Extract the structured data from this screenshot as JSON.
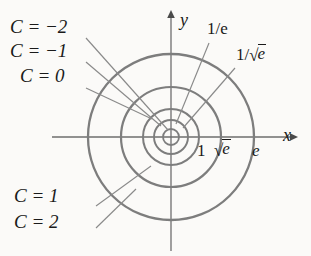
{
  "figure": {
    "type": "contour-plot",
    "colors": {
      "background": "#fbfaf8",
      "circle": "#7d7d7d",
      "axis": "#6e6e6e",
      "leader": "#8a8a8a",
      "text": "#1a1a1a"
    },
    "center": {
      "x": 171,
      "y": 137
    },
    "axes": {
      "x_label": "x",
      "y_label": "y",
      "x_start": 52,
      "x_end": 297,
      "y_start": 11,
      "y_end": 251
    },
    "circles": [
      {
        "level": "C = -2",
        "radius": 8,
        "tick_label": ""
      },
      {
        "level": "C = -1",
        "radius": 17,
        "tick_label": "1/e"
      },
      {
        "level": "C = 0",
        "radius": 28,
        "tick_label": "1"
      },
      {
        "level": "C = 1",
        "radius": 50,
        "tick_label": "sqrt(e)"
      },
      {
        "level": "C = 2",
        "radius": 83,
        "tick_label": "e"
      }
    ],
    "labels": {
      "c_minus2": "C = −2",
      "c_minus1": "C = −1",
      "c_zero": "C = 0",
      "c_one": "C = 1",
      "c_two": "C = 2",
      "one_over_e": "1/e",
      "one_over_sqrt_e_prefix": "1/",
      "one_over_sqrt_e_radicand": "e",
      "tick_one": "1",
      "tick_sqrt_e_radicand": "e",
      "tick_e": "e",
      "axis_x": "x",
      "axis_y": "y",
      "radical_sign": "√"
    }
  }
}
